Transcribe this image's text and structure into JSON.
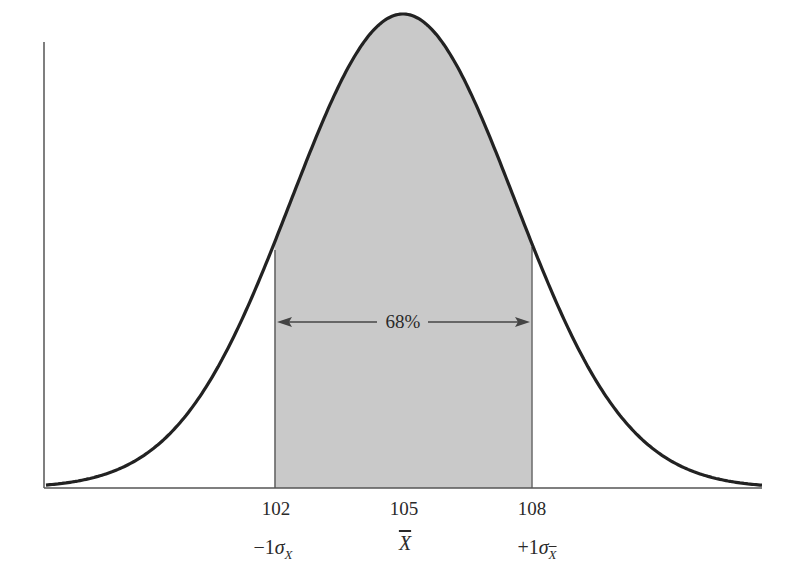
{
  "chart_data": {
    "type": "area",
    "title": "",
    "xlabel": "",
    "ylabel": "",
    "distribution": "normal",
    "mean": 105,
    "sigma": 3,
    "x_ticks": [
      102,
      105,
      108
    ],
    "x_tick_labels": [
      "102",
      "105",
      "108"
    ],
    "symbol_labels": [
      "-1σX",
      "X̄",
      "+1σX̄"
    ],
    "shaded_region": {
      "from": 102,
      "to": 108,
      "label": "68%"
    },
    "annotation": "68%",
    "grid": false,
    "legend": null
  },
  "labels": {
    "tick_102": "102",
    "tick_105": "105",
    "tick_108": "108",
    "sym_left_prefix": "−1",
    "sym_left_sigma": "σ",
    "sym_left_sub": "X",
    "sym_mid": "X",
    "sym_right_prefix": "+1",
    "sym_right_sigma": "σ",
    "sym_right_sub": "X",
    "percent": "68%"
  },
  "colors": {
    "curve": "#222222",
    "shade": "#c9c9c9",
    "axis": "#555555"
  }
}
